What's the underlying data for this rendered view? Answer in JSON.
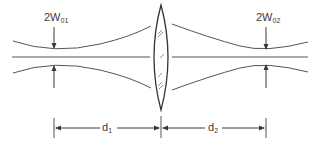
{
  "diagram": {
    "labels": {
      "waist_left_main": "2W",
      "waist_left_sub": "01",
      "waist_right_main": "2W",
      "waist_right_sub": "02",
      "distance_left_main": "d",
      "distance_left_sub": "1",
      "distance_right_main": "d",
      "distance_right_sub": "2"
    },
    "elements": [
      {
        "name": "input-beam-waist",
        "label": "2W01"
      },
      {
        "name": "lens",
        "label": ""
      },
      {
        "name": "output-beam-waist",
        "label": "2W02"
      },
      {
        "name": "distance-d1",
        "label": "d1"
      },
      {
        "name": "distance-d2",
        "label": "d2"
      }
    ],
    "colors": {
      "line": "#4a4a4a",
      "text": "#3a3a3a",
      "background": "#ffffff"
    }
  }
}
